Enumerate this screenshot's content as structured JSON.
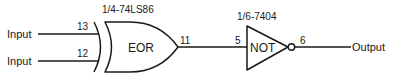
{
  "diagram": {
    "type": "logic-circuit",
    "colors": {
      "line": "#1a1a1a",
      "background": "#ffffff"
    },
    "inputs": [
      {
        "label": "Input",
        "pin": "13"
      },
      {
        "label": "Input",
        "pin": "12"
      }
    ],
    "gates": [
      {
        "id": "xor",
        "chip_label": "1/4-74LS86",
        "symbol_label": "EOR",
        "input_pins": [
          "13",
          "12"
        ],
        "output_pin": "11"
      },
      {
        "id": "not",
        "chip_label": "1/6-7404",
        "symbol_label": "NOT",
        "input_pin": "5",
        "output_pin": "6"
      }
    ],
    "output": {
      "label": "Output"
    }
  }
}
